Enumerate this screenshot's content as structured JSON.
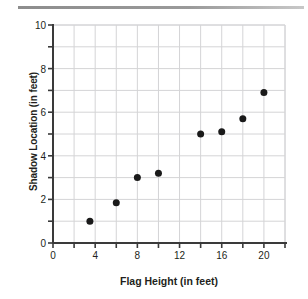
{
  "figure": {
    "name": "scatter-plot-flag-height-shadow-location"
  },
  "chart_data": {
    "type": "scatter",
    "title": "",
    "xlabel": "Flag Height (in feet)",
    "ylabel": "Shadow Location (in feet)",
    "xlim": [
      0,
      22
    ],
    "ylim": [
      0,
      10
    ],
    "grid": true,
    "legend": null,
    "x_major_ticks": [
      0,
      4,
      8,
      12,
      16,
      20
    ],
    "x_minor_ticks": [
      2,
      6,
      10,
      14,
      18,
      22
    ],
    "y_major_ticks": [
      0,
      2,
      4,
      6,
      8,
      10
    ],
    "y_minor_ticks": [
      1,
      3,
      5,
      7,
      9
    ],
    "x_tick_labels": [
      "0",
      "4",
      "8",
      "12",
      "16",
      "20"
    ],
    "y_tick_labels": [
      "0",
      "2",
      "4",
      "6",
      "8",
      "10"
    ],
    "marker": {
      "shape": "circle",
      "color": "#1a1a1a",
      "size_px": 7
    },
    "points": [
      {
        "x": 3.5,
        "y": 1.0
      },
      {
        "x": 6.0,
        "y": 1.85
      },
      {
        "x": 8.0,
        "y": 3.0
      },
      {
        "x": 10.0,
        "y": 3.2
      },
      {
        "x": 14.0,
        "y": 5.0
      },
      {
        "x": 16.0,
        "y": 5.1
      },
      {
        "x": 18.0,
        "y": 5.7
      },
      {
        "x": 20.0,
        "y": 6.9
      }
    ],
    "colors": {
      "axis": "#3a3a3a",
      "grid": "#d4d4d6",
      "text": "#231f20",
      "marker": "#1a1a1a",
      "background": "#ffffff"
    }
  }
}
